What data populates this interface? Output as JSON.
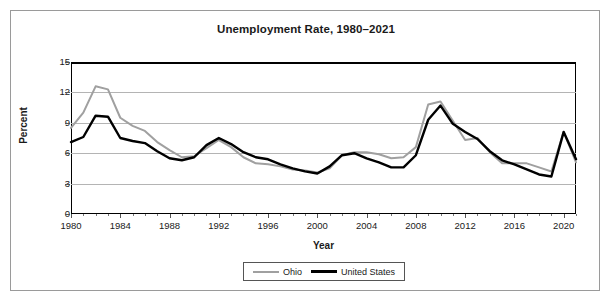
{
  "chart_data": {
    "type": "line",
    "title": "Unemployment Rate, 1980–2021",
    "xlabel": "Year",
    "ylabel": "Percent",
    "xlim": [
      1980,
      2021
    ],
    "ylim": [
      0,
      15
    ],
    "yticks": [
      0,
      3,
      6,
      9,
      12,
      15
    ],
    "xticks": [
      1980,
      1984,
      1988,
      1992,
      1996,
      2000,
      2004,
      2008,
      2012,
      2016,
      2020
    ],
    "grid": "horizontal",
    "legend_position": "bottom-center",
    "x": [
      1980,
      1981,
      1982,
      1983,
      1984,
      1985,
      1986,
      1987,
      1988,
      1989,
      1990,
      1991,
      1992,
      1993,
      1994,
      1995,
      1996,
      1997,
      1998,
      1999,
      2000,
      2001,
      2002,
      2003,
      2004,
      2005,
      2006,
      2007,
      2008,
      2009,
      2010,
      2011,
      2012,
      2013,
      2014,
      2015,
      2016,
      2017,
      2018,
      2019,
      2020,
      2021
    ],
    "series": [
      {
        "name": "Ohio",
        "color": "#a0a0a0",
        "values": [
          8.5,
          10.0,
          12.6,
          12.3,
          9.5,
          8.7,
          8.2,
          7.1,
          6.3,
          5.6,
          5.7,
          6.5,
          7.3,
          6.6,
          5.6,
          5.0,
          4.9,
          4.7,
          4.4,
          4.3,
          4.1,
          4.5,
          5.8,
          6.1,
          6.1,
          5.9,
          5.5,
          5.6,
          6.6,
          10.8,
          11.1,
          9.2,
          7.3,
          7.5,
          6.1,
          5.0,
          5.0,
          5.0,
          4.6,
          4.2,
          8.1,
          5.1
        ]
      },
      {
        "name": "United States",
        "color": "#000000",
        "values": [
          7.1,
          7.6,
          9.7,
          9.6,
          7.5,
          7.2,
          7.0,
          6.2,
          5.5,
          5.3,
          5.6,
          6.8,
          7.5,
          6.9,
          6.1,
          5.6,
          5.4,
          4.9,
          4.5,
          4.2,
          4.0,
          4.7,
          5.8,
          6.0,
          5.5,
          5.1,
          4.6,
          4.6,
          5.8,
          9.3,
          10.7,
          8.9,
          8.1,
          7.4,
          6.2,
          5.3,
          4.9,
          4.4,
          3.9,
          3.7,
          8.1,
          5.4
        ]
      }
    ]
  },
  "legend": {
    "entries": [
      {
        "label": "Ohio"
      },
      {
        "label": "United States"
      }
    ]
  }
}
